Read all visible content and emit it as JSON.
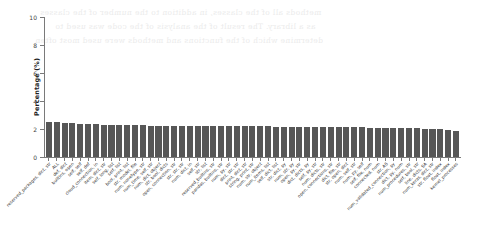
{
  "figure": {
    "background_color": "#ffffff",
    "bar_color": "#575757",
    "axis_color": "#7a7a7a",
    "text_color": "#2b2b2b"
  },
  "bleed_text": [
    "methods all of the classes, in addition to the number of the classes",
    "as a library. The result of the analysis of the code was used to",
    "determine which of the functions and methods were used most often"
  ],
  "chart_data": {
    "type": "bar",
    "title": "",
    "subtitle": "",
    "xlabel": "",
    "ylabel": "Percentage (%)",
    "ylim": [
      0,
      10
    ],
    "yticks": [
      0,
      2,
      4,
      6,
      8,
      10
    ],
    "ytick_labels": [
      "0",
      "2",
      "4",
      "6",
      "8",
      "10"
    ],
    "grid": false,
    "legend": null,
    "orientation": "vertical",
    "categories": [
      "reserved_packages, dict, str",
      "ALL",
      "def, dict",
      "builtins, open",
      "self, self",
      "self, def",
      "cloud_connection, in",
      "item, dict, str",
      "self, long, list",
      "self, list",
      "bool, print, list",
      "str, model, file",
      "num, nonetype, str",
      "num_time, self, str",
      "num, dict, object",
      "str, bool, dicts",
      "open, connection, str",
      "str, str, str",
      "num, dict, in",
      "self, str",
      "str, list",
      "reserved_builtins, str",
      "pandas, builtins, str",
      "num, py, str",
      "dict, str, str",
      "print, dict, str",
      "string, print, str",
      "num, str, object",
      "num_items, list",
      "self, dict, list",
      "str, dict, py",
      "num, str, py",
      "open, py, str",
      "dict, dicts, py",
      "self, py, str",
      "num, dicts, str",
      "open, connections, str",
      "dict, file, str",
      "str, open, dict",
      "num, self, str",
      "num, py, self",
      "self, file, num",
      "connected, num",
      "str, AS",
      "num_validated_connection, py",
      "dict, py, num",
      "num_procedures, str",
      "self, bool, str",
      "line, dicts, SA",
      "num_keras, dict, str",
      "str, float, index",
      "float, index",
      "kernel_processes"
    ],
    "values": [
      2.52,
      2.48,
      2.44,
      2.4,
      2.37,
      2.35,
      2.33,
      2.31,
      2.3,
      2.29,
      2.28,
      2.27,
      2.26,
      2.25,
      2.25,
      2.24,
      2.24,
      2.23,
      2.23,
      2.22,
      2.22,
      2.21,
      2.21,
      2.2,
      2.2,
      2.19,
      2.19,
      2.18,
      2.18,
      2.17,
      2.17,
      2.16,
      2.16,
      2.15,
      2.15,
      2.14,
      2.14,
      2.13,
      2.12,
      2.12,
      2.11,
      2.1,
      2.09,
      2.08,
      2.07,
      2.06,
      2.05,
      2.04,
      2.02,
      2.0,
      1.97,
      1.93,
      1.88
    ]
  }
}
